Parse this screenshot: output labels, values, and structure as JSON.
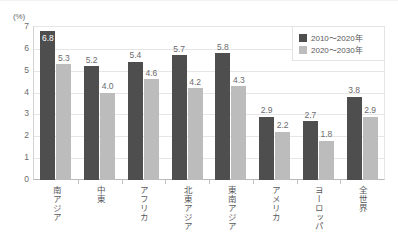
{
  "chart_data": {
    "type": "bar",
    "title": "",
    "xlabel": "",
    "ylabel": "(%)",
    "unit_label": "(%)",
    "ylim": [
      0,
      7
    ],
    "ytick_step": 1,
    "yticks": [
      "0",
      "1",
      "2",
      "3",
      "4",
      "5",
      "6",
      "7"
    ],
    "grid": true,
    "legend_position": "top-right",
    "categories": [
      "南アジア",
      "中東",
      "アフリカ",
      "北東アジア",
      "東南アジア",
      "アメリカ",
      "ヨーロッパ",
      "全世界"
    ],
    "series": [
      {
        "name": "2010～2020年",
        "color": "#4e4e4e",
        "values": [
          6.8,
          5.2,
          5.4,
          5.7,
          5.8,
          2.9,
          2.7,
          3.8
        ],
        "labels": [
          "6.8",
          "5.2",
          "5.4",
          "5.7",
          "5.8",
          "2.9",
          "2.7",
          "3.8"
        ]
      },
      {
        "name": "2020～2030年",
        "color": "#bcbcbc",
        "values": [
          5.3,
          4.0,
          4.6,
          4.2,
          4.3,
          2.2,
          1.8,
          2.9
        ],
        "labels": [
          "5.3",
          "4.0",
          "4.6",
          "4.2",
          "4.3",
          "2.2",
          "1.8",
          "2.9"
        ]
      }
    ]
  },
  "legend": {
    "items": [
      {
        "label": "2010～2020年",
        "color": "#4e4e4e"
      },
      {
        "label": "2020～2030年",
        "color": "#bcbcbc"
      }
    ]
  },
  "colors": {
    "series_dark": "#4e4e4e",
    "series_light": "#bcbcbc",
    "gridline": "#e6e6e8",
    "axis": "#b9b9bb",
    "text": "#58585a"
  }
}
